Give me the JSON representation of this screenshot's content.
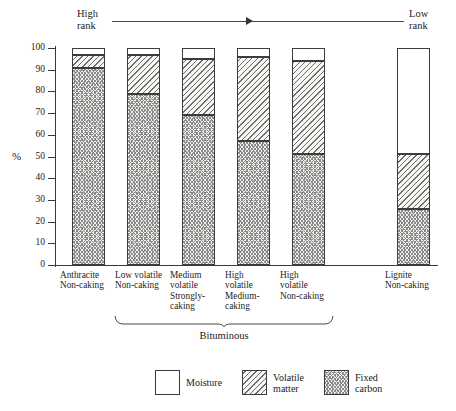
{
  "rank_axis": {
    "high_label": "High\nrank",
    "low_label": "Low\nrank"
  },
  "axes": {
    "ylabel": "%",
    "yticks": [
      "100",
      "90",
      "80",
      "70",
      "60",
      "50",
      "40",
      "30",
      "20",
      "10",
      "0"
    ]
  },
  "group_bracket": {
    "label": "Bituminous"
  },
  "legend": {
    "items": [
      {
        "key": "moisture",
        "label": "Moisture"
      },
      {
        "key": "volatile",
        "label": "Volatile\nmatter"
      },
      {
        "key": "carbon",
        "label": "Fixed\ncarbon"
      }
    ]
  },
  "colors": {
    "axis": "#3a3a3a",
    "hatch": "#6d6d6d",
    "moisture_fill": "#ffffff",
    "volatile_fill": "#f7f7f4",
    "carbon_fill": "#efefec"
  },
  "chart_data": {
    "type": "bar",
    "stacked": true,
    "title": "",
    "xlabel": "",
    "ylabel": "%",
    "ylim": [
      0,
      100
    ],
    "grid": false,
    "legend_position": "bottom",
    "annotations": [
      "High rank",
      "Low rank",
      "Bituminous"
    ],
    "categories": [
      "Anthracite\nNon-caking",
      "Low volatile\nNon-caking",
      "Medium\nvolatile\nStrongly-\ncaking",
      "High\nvolatile\nMedium-\ncaking",
      "High\nvolatile\nNon-caking",
      "Lignite\nNon-caking"
    ],
    "series": [
      {
        "name": "Fixed carbon",
        "values": [
          91,
          79,
          69,
          57,
          51,
          26
        ]
      },
      {
        "name": "Volatile matter",
        "values": [
          6,
          18,
          26,
          39,
          43,
          25
        ]
      },
      {
        "name": "Moisture",
        "values": [
          3,
          3,
          5,
          4,
          6,
          49
        ]
      }
    ],
    "bars": [
      {
        "category": "Anthracite Non-caking",
        "carbon_top": 91,
        "volatile_top": 97
      },
      {
        "category": "Low volatile Non-caking",
        "carbon_top": 79,
        "volatile_top": 97
      },
      {
        "category": "Medium volatile Strongly-caking",
        "carbon_top": 69,
        "volatile_top": 95
      },
      {
        "category": "High volatile Medium-caking",
        "carbon_top": 57,
        "volatile_top": 96
      },
      {
        "category": "High volatile Non-caking",
        "carbon_top": 51,
        "volatile_top": 94
      },
      {
        "category": "Lignite Non-caking",
        "carbon_top": 26,
        "volatile_top": 51
      }
    ]
  }
}
